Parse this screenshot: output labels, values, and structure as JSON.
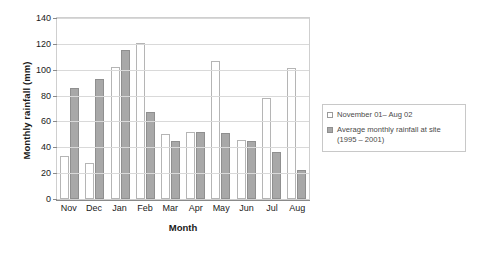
{
  "chart_data": {
    "type": "bar",
    "title": "",
    "xlabel": "Month",
    "ylabel": "Monthly rainfall (mm)",
    "ylim": [
      0,
      140
    ],
    "ytick_step": 20,
    "yticks": [
      0,
      20,
      40,
      60,
      80,
      100,
      120,
      140
    ],
    "grid": true,
    "legend_position": "right",
    "categories": [
      "Nov",
      "Dec",
      "Jan",
      "Feb",
      "Mar",
      "Apr",
      "May",
      "Jun",
      "Jul",
      "Aug"
    ],
    "series": [
      {
        "name": "November 01– Aug 02",
        "color": "#ffffff",
        "edge_color": "#b5b5b5",
        "values": [
          33,
          28,
          102,
          120.5,
          50,
          51.5,
          107,
          45.5,
          78.5,
          101
        ]
      },
      {
        "name": "Average monthly rainfall at site (1995 – 2001)",
        "color": "#a8a8a8",
        "edge_color": "#8f8f8f",
        "values": [
          85.5,
          93,
          115,
          67,
          44.5,
          51.5,
          51,
          44.5,
          36.5,
          22.5
        ]
      }
    ]
  },
  "axes": {
    "y_title": "Monthly rainfall (mm)",
    "x_title": "Month",
    "y_ticks": [
      "0",
      "20",
      "40",
      "60",
      "80",
      "100",
      "120",
      "140"
    ],
    "x_ticks": [
      "Nov",
      "Dec",
      "Jan",
      "Feb",
      "Mar",
      "Apr",
      "May",
      "Jun",
      "Jul",
      "Aug"
    ]
  },
  "legend": {
    "entries": [
      {
        "swatch": "s0",
        "line1": "November 01– Aug 02",
        "line2": ""
      },
      {
        "swatch": "s1",
        "line1": "Average monthly rainfall at site",
        "line2": "(1995 – 2001)"
      }
    ]
  }
}
